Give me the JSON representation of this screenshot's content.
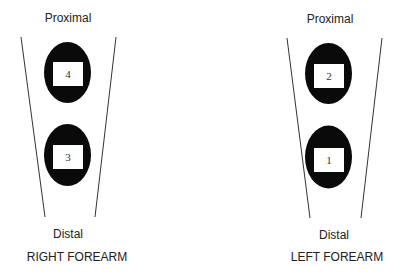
{
  "forearms": [
    {
      "title": "RIGHT FOREARM",
      "proximal_label": "Proximal",
      "distal_label": "Distal",
      "sites": [
        {
          "number": "4",
          "position": "proximal"
        },
        {
          "number": "3",
          "position": "distal"
        }
      ]
    },
    {
      "title": "LEFT FOREARM",
      "proximal_label": "Proximal",
      "distal_label": "Distal",
      "sites": [
        {
          "number": "2",
          "position": "proximal"
        },
        {
          "number": "1",
          "position": "distal"
        }
      ]
    }
  ],
  "colors": {
    "site_fill": "#0a0a0a",
    "box_fill": "#ffffff",
    "line": "#333333",
    "text": "#222222"
  }
}
